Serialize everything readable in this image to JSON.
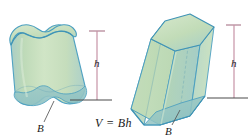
{
  "figure": {
    "caption_formula": "V = Bh",
    "background_color": "#ffffff",
    "outline_color": "#4a9fc0",
    "fill_color_light": "#cfe3c3",
    "fill_color_mid": "#b9d6ae",
    "fill_color_top": "#c5ddbb",
    "fill_color_base": "#a9cfc9",
    "measure_line_color": "#c08fa0",
    "baseline_color": "#4a4a4a",
    "leader_line_color": "#555555",
    "solids": [
      {
        "name": "oblique-cylinder",
        "height_label": "h",
        "base_label": "B"
      },
      {
        "name": "hexagonal-prism",
        "height_label": "h",
        "base_label": "B"
      }
    ],
    "labels": {
      "height_left": "h",
      "height_right": "h",
      "base_left": "B",
      "base_right": "B"
    }
  }
}
